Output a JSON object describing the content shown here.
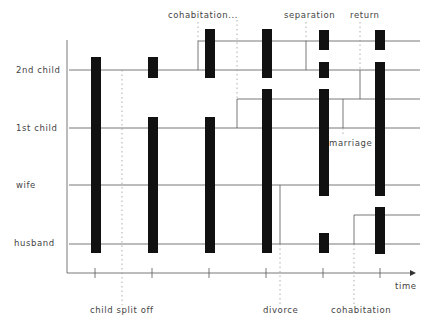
{
  "diagram": {
    "type": "lifeline-timeline",
    "axis": {
      "x_label": "time",
      "ticks": 6
    },
    "rows": [
      {
        "id": "2nd_child",
        "label": "2nd child"
      },
      {
        "id": "1st_child",
        "label": "1st child"
      },
      {
        "id": "wife",
        "label": "wife"
      },
      {
        "id": "husband",
        "label": "husband"
      }
    ],
    "events_top": [
      {
        "label": "cohabitation...",
        "id": "cohabitation_top"
      },
      {
        "label": "separation",
        "id": "separation"
      },
      {
        "label": "return",
        "id": "return"
      }
    ],
    "events_bottom": [
      {
        "label": "child split off",
        "id": "child_split_off"
      },
      {
        "label": "divorce",
        "id": "divorce"
      },
      {
        "label": "cohabitation",
        "id": "cohabitation_bottom"
      }
    ],
    "events_inline": [
      {
        "label": "marriage",
        "id": "marriage"
      }
    ],
    "colors": {
      "bar": "#111111",
      "line": "#555555",
      "dotted": "#999999",
      "text": "#444444"
    }
  }
}
